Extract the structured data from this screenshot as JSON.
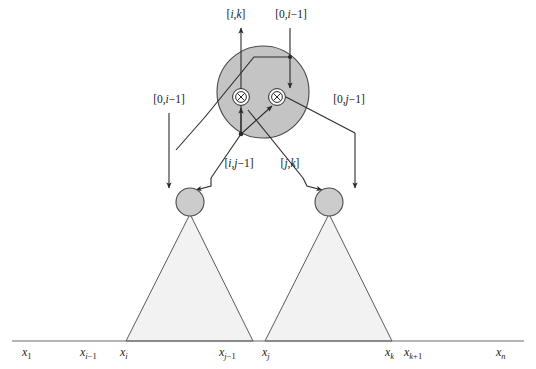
{
  "figure": {
    "colors": {
      "big_circle_fill": "#c4c4c4",
      "big_circle_stroke": "#4a4a4a",
      "node_circle_fill": "#cccccc",
      "node_circle_stroke": "#4a4a4a",
      "triangle_fill": "#f2f2f2",
      "triangle_stroke": "#5a5a5a",
      "line": "#2b2b2b",
      "axis": "#6b6b6b",
      "text": "#1a1a1a",
      "background": "#ffffff"
    },
    "top_labels": [
      {
        "name": "label-i-k-out",
        "text": "[i,k]",
        "parts": [
          "[",
          "i",
          ",",
          "k",
          "]"
        ],
        "x": 236,
        "y": 18
      },
      {
        "name": "label-0-i-minus-1-in",
        "text": "[0,i−1]",
        "parts": [
          "[0,",
          "i",
          "−1]"
        ],
        "x": 285,
        "y": 18
      }
    ],
    "side_labels": [
      {
        "name": "label-0-i-minus-1-out",
        "text": "[0,i−1]",
        "x": 169,
        "y": 103
      },
      {
        "name": "label-0-j-minus-1-in",
        "text": "[0,j−1]",
        "x": 315,
        "y": 103
      }
    ],
    "mid_labels": [
      {
        "name": "label-i-j-minus-1",
        "text": "[i,j−1]",
        "x": 220,
        "y": 166
      },
      {
        "name": "label-j-k",
        "text": "[j,k]",
        "x": 272,
        "y": 166
      }
    ],
    "axis_ticks": [
      {
        "name": "axis-tick-x-1",
        "base": "x",
        "sub": "1",
        "x": 22,
        "y": 355
      },
      {
        "name": "axis-tick-x-i-minus-1",
        "base": "x",
        "sub": "i−1",
        "x": 83,
        "y": 355
      },
      {
        "name": "axis-tick-x-i",
        "base": "x",
        "sub": "i",
        "x": 123,
        "y": 355
      },
      {
        "name": "axis-tick-x-j-minus-1",
        "base": "x",
        "sub": "j−1",
        "x": 222,
        "y": 355
      },
      {
        "name": "axis-tick-x-j",
        "base": "x",
        "sub": "j",
        "x": 264,
        "y": 355
      },
      {
        "name": "axis-tick-x-k",
        "base": "x",
        "sub": "k",
        "x": 387,
        "y": 355
      },
      {
        "name": "axis-tick-x-k-plus-1",
        "base": "x",
        "sub": "k+1",
        "x": 406,
        "y": 355
      },
      {
        "name": "axis-tick-x-n",
        "base": "x",
        "sub": "n",
        "x": 497,
        "y": 355
      }
    ],
    "nodes": {
      "big_circle": {
        "name": "root-cluster-circle",
        "cx": 263,
        "cy": 92,
        "r": 46
      },
      "operator_left": {
        "name": "operator-node-left",
        "cx": 241,
        "cy": 97,
        "r": 8,
        "glyph": "⊗"
      },
      "operator_right": {
        "name": "operator-node-right",
        "cx": 277,
        "cy": 97,
        "r": 8,
        "glyph": "⊗"
      },
      "child_left": {
        "name": "child-node-left",
        "cx": 190,
        "cy": 202,
        "r": 14
      },
      "child_right": {
        "name": "child-node-right",
        "cx": 329,
        "cy": 202,
        "r": 14
      }
    },
    "triangles": [
      {
        "name": "subtree-triangle-left",
        "apex_x": 190,
        "apex_y": 214,
        "left_x": 126,
        "right_x": 253,
        "base_y": 341
      },
      {
        "name": "subtree-triangle-right",
        "apex_x": 329,
        "apex_y": 214,
        "left_x": 265,
        "right_x": 392,
        "base_y": 341
      }
    ],
    "axis_line": {
      "name": "x-axis-line",
      "x1": 12,
      "x2": 524,
      "y": 341
    }
  }
}
